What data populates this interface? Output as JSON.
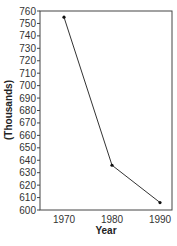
{
  "chart_data": {
    "type": "line",
    "title": "",
    "xlabel": "Year",
    "ylabel": "(Thousands)",
    "categories": [
      "1970",
      "1980",
      "1990"
    ],
    "x": [
      1970,
      1980,
      1990
    ],
    "values": [
      755,
      636,
      606
    ],
    "series": [
      {
        "name": "",
        "values": [
          755,
          636,
          606
        ]
      }
    ],
    "ylim": [
      600,
      760
    ],
    "yticks": [
      600,
      610,
      620,
      630,
      640,
      650,
      660,
      670,
      680,
      690,
      700,
      710,
      720,
      730,
      740,
      750,
      760
    ],
    "xticks": [
      "1970",
      "1980",
      "1990"
    ],
    "grid": false,
    "legend": "none",
    "colors": {
      "line": "#333333",
      "marker": "#111111",
      "frame": "#444444"
    }
  }
}
